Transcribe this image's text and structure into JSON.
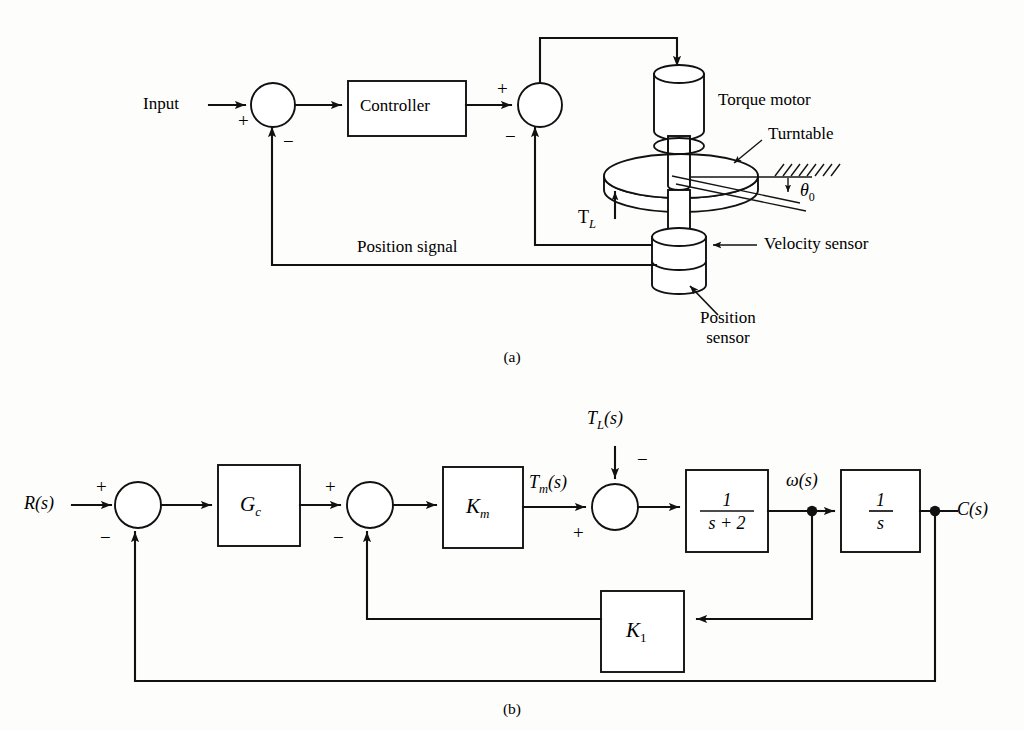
{
  "figure": {
    "caption_a": "(a)",
    "caption_b": "(b)"
  },
  "diagram_a": {
    "name": "turntable-position-control-schematic",
    "labels": {
      "input": "Input",
      "controller": "Controller",
      "torque_motor": "Torque motor",
      "turntable": "Turntable",
      "velocity_sensor": "Velocity sensor",
      "position_sensor_line1": "Position",
      "position_sensor_line2": "sensor",
      "position_signal": "Position signal",
      "theta_symbol": "θ",
      "theta_subscript": "0",
      "torque_load_symbol": "T",
      "torque_load_subscript": "L"
    },
    "signs": {
      "summer1_plus": "+",
      "summer1_minus": "−",
      "summer2_plus": "+",
      "summer2_minus": "−"
    }
  },
  "diagram_b": {
    "name": "equivalent-block-diagram",
    "signals": {
      "input": "R(s)",
      "input_var": "R",
      "input_arg": "(s)",
      "torque_motor_output_var": "T",
      "torque_motor_output_sub": "m",
      "torque_motor_output_arg": "(s)",
      "load_torque_var": "T",
      "load_torque_sub": "L",
      "load_torque_arg": "(s)",
      "omega_var": "ω",
      "omega_arg": "(s)",
      "output_var": "C",
      "output_arg": "(s)"
    },
    "blocks": [
      {
        "id": "controller",
        "label_var": "G",
        "label_sub": "c",
        "kind": "gain"
      },
      {
        "id": "motor-gain",
        "label_var": "K",
        "label_sub": "m",
        "kind": "gain"
      },
      {
        "id": "plant",
        "label_num": "1",
        "label_den": "s + 2",
        "kind": "fraction"
      },
      {
        "id": "integrator",
        "label_num": "1",
        "label_den": "s",
        "kind": "fraction"
      },
      {
        "id": "velocity-feedback",
        "label_var": "K",
        "label_sub": "1",
        "kind": "gain"
      }
    ],
    "signs": {
      "summer1_plus": "+",
      "summer1_minus": "−",
      "summer2_plus": "+",
      "summer2_minus": "−",
      "summer3_plus": "+",
      "summer3_minus": "−"
    }
  },
  "colors": {
    "ink": "#111111",
    "paper": "#fdfdfc"
  }
}
